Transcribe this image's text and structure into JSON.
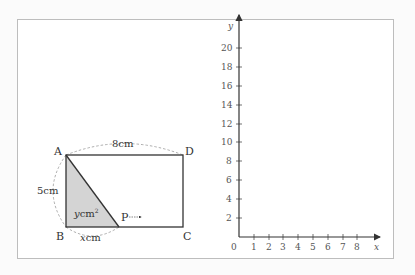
{
  "figure": {
    "rectangle": {
      "vertices": {
        "A": "A",
        "B": "B",
        "C": "C",
        "D": "D"
      },
      "point_label": "P",
      "width_label": "8cm",
      "height_label": "5cm",
      "area_label_var": "y",
      "area_label_unit": "cm",
      "area_label_exp": "2",
      "segment_label_var": "x",
      "segment_label_unit": "cm"
    },
    "graph": {
      "x_axis_label": "x",
      "y_axis_label": "y",
      "origin_label": "0",
      "x_ticks": [
        "1",
        "2",
        "3",
        "4",
        "5",
        "6",
        "7",
        "8"
      ],
      "y_ticks": [
        "2",
        "4",
        "6",
        "8",
        "10",
        "12",
        "14",
        "16",
        "18",
        "20"
      ]
    }
  },
  "colors": {
    "shaded_triangle": "#d4d4d4",
    "lines": "#333333",
    "dashed_arcs": "#999999",
    "frame_border": "#bdbdbd"
  }
}
